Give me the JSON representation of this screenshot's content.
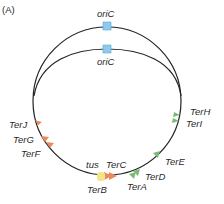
{
  "panel_label": "(A)",
  "origin": {
    "outer_label": "oriC",
    "inner_label": "oriC",
    "color": "#8fc9ee"
  },
  "tus": {
    "label": "tus",
    "color": "#f2e48a"
  },
  "ter_sites_orange": [
    {
      "name": "TerJ"
    },
    {
      "name": "TerG"
    },
    {
      "name": "TerF"
    },
    {
      "name": "TerB"
    },
    {
      "name": "TerC"
    }
  ],
  "ter_sites_green": [
    {
      "name": "TerA"
    },
    {
      "name": "TerD"
    },
    {
      "name": "TerE"
    },
    {
      "name": "TerI"
    },
    {
      "name": "TerH"
    }
  ],
  "colors": {
    "orange": "#ec8a5e",
    "green": "#7dba7a",
    "line": "#222222"
  }
}
